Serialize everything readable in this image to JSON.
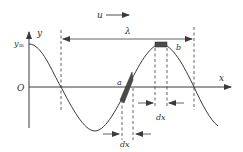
{
  "diagram": {
    "labels": {
      "velocity": "u",
      "y_axis": "y",
      "x_axis": "x",
      "amplitude": "y",
      "amplitude_sub": "m",
      "origin": "O",
      "wavelength": "λ",
      "element_a": "a",
      "element_b": "b",
      "dx_b": "dx",
      "dx_a": "dx"
    },
    "colors": {
      "line": "#3a3a3a",
      "element_fill": "#4a4a4a",
      "background": "#ffffff"
    }
  }
}
